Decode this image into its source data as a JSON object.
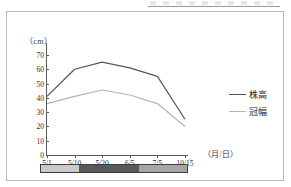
{
  "chart_data": {
    "type": "line",
    "title": "",
    "xlabel": "（月/日）",
    "ylabel": "（cm）",
    "categories": [
      "5/1",
      "5/10",
      "5/20",
      "6/5",
      "7/5",
      "10/15"
    ],
    "ylim": [
      0,
      70
    ],
    "yticks": [
      0,
      10,
      20,
      30,
      40,
      50,
      60,
      70
    ],
    "grid": false,
    "legend_position": "right",
    "series": [
      {
        "name": "株高",
        "color": "#555555",
        "values": [
          41,
          60,
          65,
          61,
          55,
          25
        ]
      },
      {
        "name": "冠幅",
        "color": "#b4b4b4",
        "values": [
          36,
          41,
          45.5,
          42,
          36,
          20
        ]
      }
    ]
  },
  "axis": {
    "y_unit": "（cm）",
    "x_unit": "（月/日）",
    "y_tick_labels": [
      "70",
      "60",
      "50",
      "40",
      "30",
      "20",
      "10",
      "0"
    ],
    "x_tick_labels": [
      "5/1",
      "5/10",
      "5/20",
      "6/5",
      "7/5",
      "10/15"
    ]
  },
  "legend": {
    "items": [
      {
        "label": "株高",
        "color": "#555555"
      },
      {
        "label": "冠幅",
        "color": "#b4b4b4"
      }
    ]
  },
  "stage_bar": {
    "segments": [
      {
        "name": "segment-early",
        "color": "#c9c9c9",
        "width_pct": 26
      },
      {
        "name": "segment-peak",
        "color": "#595959",
        "width_pct": 41
      },
      {
        "name": "segment-late",
        "color": "#a6a6a6",
        "width_pct": 33
      }
    ]
  }
}
